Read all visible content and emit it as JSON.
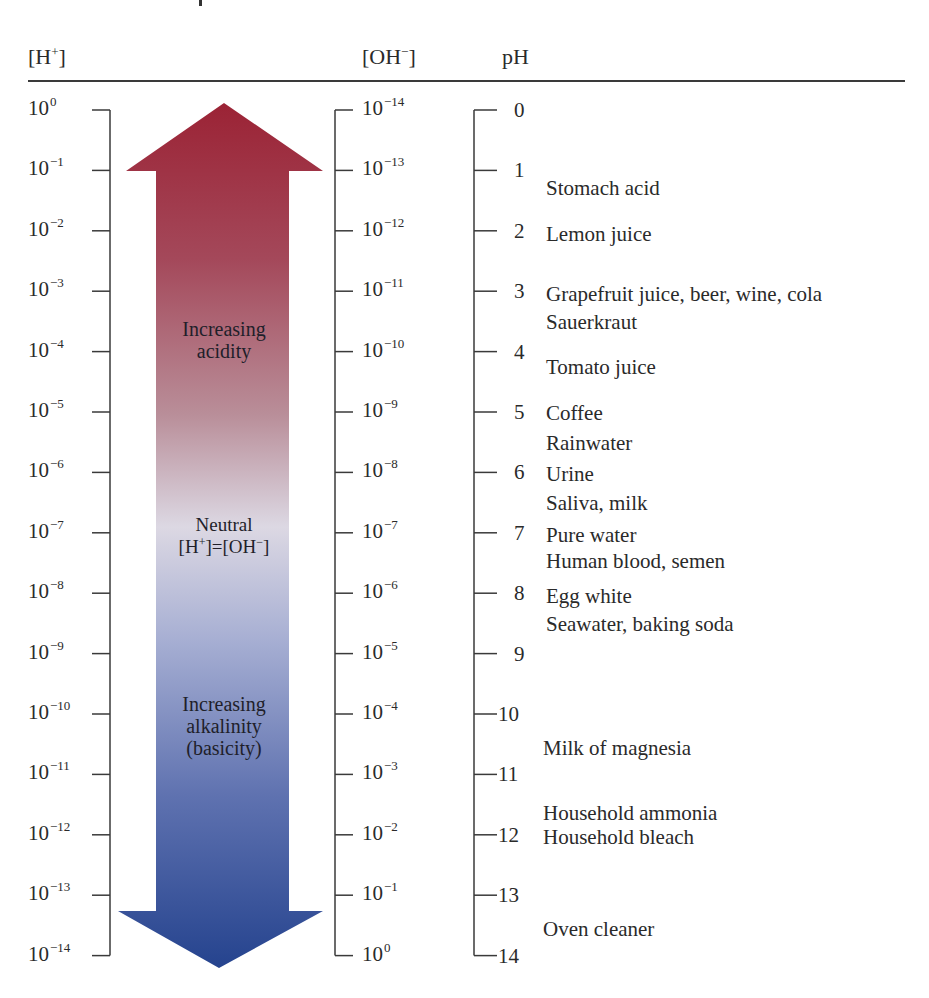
{
  "headers": {
    "h_conc": "[H+]",
    "oh_conc": "[OH−]",
    "ph": "pH"
  },
  "colors": {
    "acid_top": "#9b2335",
    "acid_mid": "#b98e99",
    "neutral": "#dcd8e3",
    "base_mid": "#a7afd3",
    "base_bottom": "#25438e",
    "axis": "#3a3a3a"
  },
  "arrow": {
    "acid_label_1": "Increasing",
    "acid_label_2": "acidity",
    "neutral_label": "Neutral",
    "neutral_eq": "[H+]=[OH−]",
    "base_label_1": "Increasing",
    "base_label_2": "alkalinity",
    "base_label_3": "(basicity)"
  },
  "axes": {
    "h_ticks": [
      "0",
      "−1",
      "−2",
      "−3",
      "−4",
      "−5",
      "−6",
      "−7",
      "−8",
      "−9",
      "−10",
      "−11",
      "−12",
      "−13",
      "−14"
    ],
    "oh_ticks": [
      "−14",
      "−13",
      "−12",
      "−11",
      "−10",
      "−9",
      "−8",
      "−7",
      "−6",
      "−5",
      "−4",
      "−3",
      "−2",
      "−1",
      "0"
    ],
    "ph_ticks": [
      "0",
      "1",
      "2",
      "3",
      "4",
      "5",
      "6",
      "7",
      "8",
      "9",
      "10",
      "11",
      "12",
      "13",
      "14"
    ],
    "base": "10"
  },
  "substances": [
    {
      "name": "Stomach acid",
      "ph_approx": 1.3
    },
    {
      "name": "Lemon juice",
      "ph_approx": 2
    },
    {
      "name": "Grapefruit juice, beer, wine, cola",
      "ph_approx": 3
    },
    {
      "name": "Sauerkraut",
      "ph_approx": 3.5
    },
    {
      "name": "Tomato juice",
      "ph_approx": 4.2
    },
    {
      "name": "Coffee",
      "ph_approx": 5
    },
    {
      "name": "Rainwater",
      "ph_approx": 5.5
    },
    {
      "name": "Urine",
      "ph_approx": 6
    },
    {
      "name": "Saliva, milk",
      "ph_approx": 6.5
    },
    {
      "name": "Pure water",
      "ph_approx": 7
    },
    {
      "name": "Human blood, semen",
      "ph_approx": 7.4
    },
    {
      "name": "Egg white",
      "ph_approx": 8
    },
    {
      "name": "Seawater, baking soda",
      "ph_approx": 8.4
    },
    {
      "name": "Milk of magnesia",
      "ph_approx": 10.5
    },
    {
      "name": "Household ammonia",
      "ph_approx": 11.6
    },
    {
      "name": "Household bleach",
      "ph_approx": 12
    },
    {
      "name": "Oven cleaner",
      "ph_approx": 13.5
    }
  ]
}
